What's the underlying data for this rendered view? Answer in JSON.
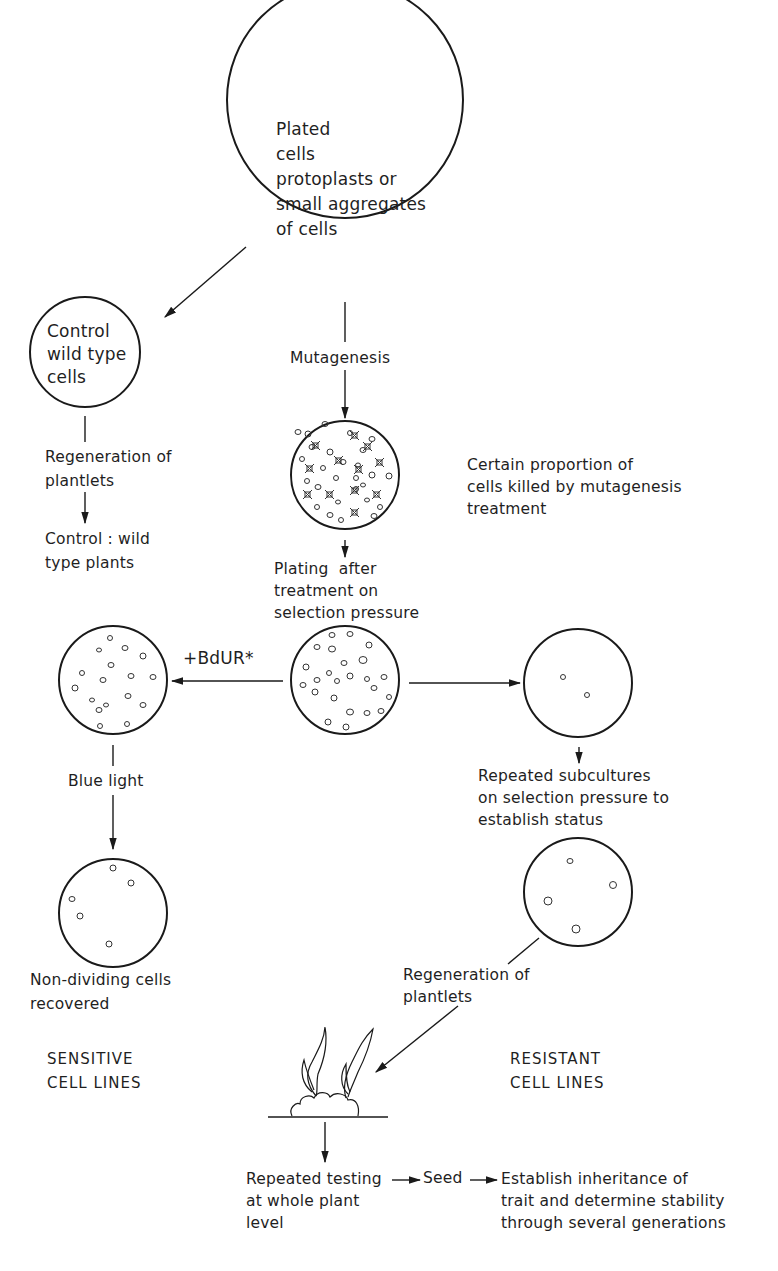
{
  "nodes": {
    "plated": {
      "text": "Plated\ncells\nprotoplasts or\nsmall aggregates\nof cells"
    },
    "control_cells": {
      "text": "Control\nwild type\ncells"
    }
  },
  "labels": {
    "mutagenesis": "Mutagenesis",
    "regeneration_left": "Regeneration of\nplantlets",
    "control_plants": "Control : wild\ntype plants",
    "killed_note": "Certain proportion of\ncells killed by mutagenesis\ntreatment",
    "plating_after": "Plating  after\ntreatment on\nselection pressure",
    "bdur": "+BdUR*",
    "blue_light": "Blue light",
    "repeated_subcultures": "Repeated subcultures\non selection pressure to\nestablish status",
    "non_dividing": "Non-dividing cells\nrecovered",
    "sensitive": "SENSITIVE\nCELL LINES",
    "regeneration_right": "Regeneration of\nplantlets",
    "resistant": "RESISTANT\nCELL LINES",
    "repeated_testing": "Repeated testing\nat whole plant\nlevel",
    "seed": "Seed",
    "establish_inheritance": "Establish inheritance of\ntrait and determine stability\nthrough several generations"
  },
  "colors": {
    "line": "#1a1a1a",
    "background": "#ffffff"
  }
}
